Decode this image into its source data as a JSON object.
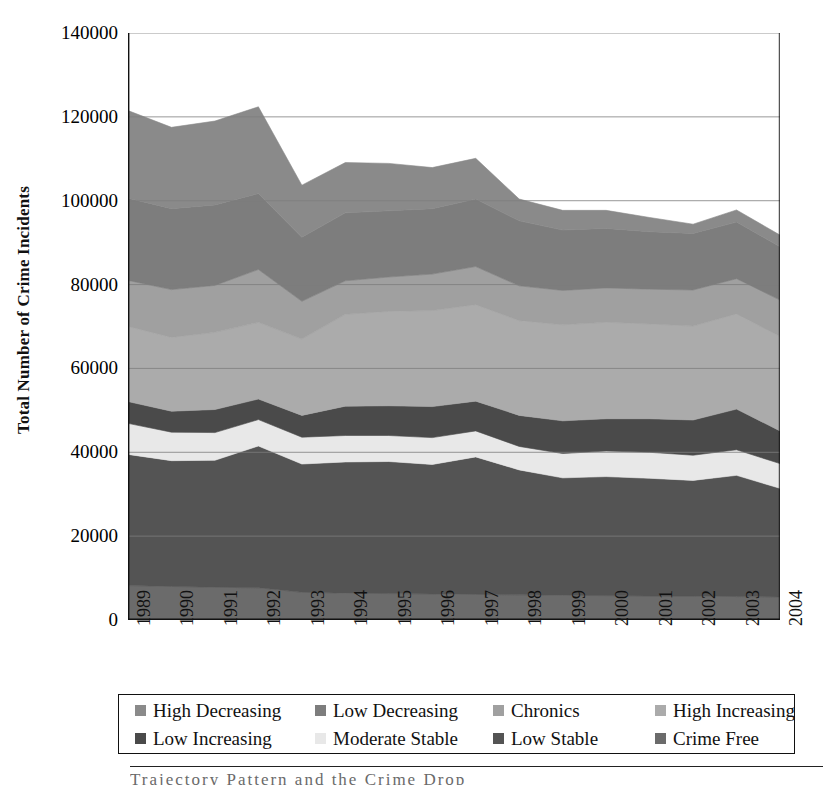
{
  "figure": {
    "y_axis_title": "Total Number of Crime Incidents",
    "bottom_caption": "Trajectory Pattern and the Crime Drop"
  },
  "axes": {
    "y_ticks": [
      "140000",
      "120000",
      "100000",
      "80000",
      "60000",
      "40000",
      "20000",
      "0"
    ],
    "x_ticks": [
      "1989",
      "1990",
      "1991",
      "1992",
      "1993",
      "1994",
      "1995",
      "1996",
      "1997",
      "1998",
      "1999",
      "2000",
      "2001",
      "2002",
      "2003",
      "2004"
    ]
  },
  "legend": {
    "row1": [
      {
        "label": "High Decreasing",
        "color": "#8a8a8a"
      },
      {
        "label": "Low Decreasing",
        "color": "#7d7d7d"
      },
      {
        "label": "Chronics",
        "color": "#a0a0a0"
      },
      {
        "label": "High Increasing",
        "color": "#ababab"
      }
    ],
    "row2": [
      {
        "label": "Low Increasing",
        "color": "#4a4a4a"
      },
      {
        "label": "Moderate Stable",
        "color": "#e8e8e8"
      },
      {
        "label": "Low Stable",
        "color": "#545454"
      },
      {
        "label": "Crime Free",
        "color": "#6b6b6b"
      }
    ]
  },
  "chart_data": {
    "type": "area",
    "stacked": true,
    "title": "",
    "xlabel": "",
    "ylabel": "Total Number of Crime Incidents",
    "xlim": [
      1989,
      2004
    ],
    "ylim": [
      0,
      140000
    ],
    "ytick_step": 20000,
    "grid": true,
    "grid_axis": "y",
    "legend_position": "below",
    "categories": [
      1989,
      1990,
      1991,
      1992,
      1993,
      1994,
      1995,
      1996,
      1997,
      1998,
      1999,
      2000,
      2001,
      2002,
      2003,
      2004
    ],
    "series": [
      {
        "name": "Crime Free",
        "color": "#6b6b6b",
        "values": [
          8200,
          8000,
          7800,
          7700,
          6600,
          6400,
          6300,
          6200,
          6100,
          6000,
          5900,
          5800,
          5700,
          5700,
          5600,
          5500
        ]
      },
      {
        "name": "Low Stable",
        "color": "#545454",
        "values": [
          31300,
          30000,
          30300,
          33800,
          30600,
          31300,
          31500,
          30900,
          32800,
          29800,
          28000,
          28400,
          28100,
          27600,
          28900,
          25900
        ]
      },
      {
        "name": "Moderate Stable",
        "color": "#e8e8e8",
        "values": [
          7400,
          6800,
          6600,
          6300,
          6400,
          6300,
          6200,
          6400,
          6200,
          5600,
          5800,
          6100,
          6200,
          6000,
          6100,
          5900
        ]
      },
      {
        "name": "Low Increasing",
        "color": "#4a4a4a",
        "values": [
          5200,
          5000,
          5500,
          4900,
          5200,
          7000,
          7100,
          7400,
          7100,
          7400,
          7800,
          7700,
          8000,
          8400,
          9700,
          7800
        ]
      },
      {
        "name": "High Increasing",
        "color": "#ababab",
        "values": [
          17900,
          17600,
          18400,
          18300,
          18200,
          21900,
          22500,
          22900,
          23000,
          22600,
          22900,
          23000,
          22600,
          22400,
          22700,
          22500
        ]
      },
      {
        "name": "Chronics",
        "color": "#a0a0a0",
        "values": [
          11000,
          11400,
          11200,
          12600,
          9000,
          8000,
          8200,
          8700,
          9100,
          8300,
          8200,
          8200,
          8300,
          8600,
          8400,
          8700
        ]
      },
      {
        "name": "Low Decreasing",
        "color": "#7d7d7d",
        "values": [
          19600,
          19300,
          19200,
          18100,
          15300,
          16200,
          15800,
          15600,
          16100,
          15500,
          14400,
          14200,
          13700,
          13500,
          13500,
          12700
        ]
      },
      {
        "name": "High Decreasing",
        "color": "#8a8a8a",
        "values": [
          20900,
          19400,
          20000,
          20700,
          12400,
          12000,
          11300,
          9800,
          9700,
          5200,
          4700,
          4300,
          3400,
          2200,
          2900,
          2800
        ]
      }
    ],
    "totals": [
      121500,
      117500,
      119000,
      122400,
      103700,
      109100,
      108900,
      107900,
      110100,
      100400,
      97700,
      97700,
      96000,
      94400,
      97800,
      91800
    ]
  }
}
